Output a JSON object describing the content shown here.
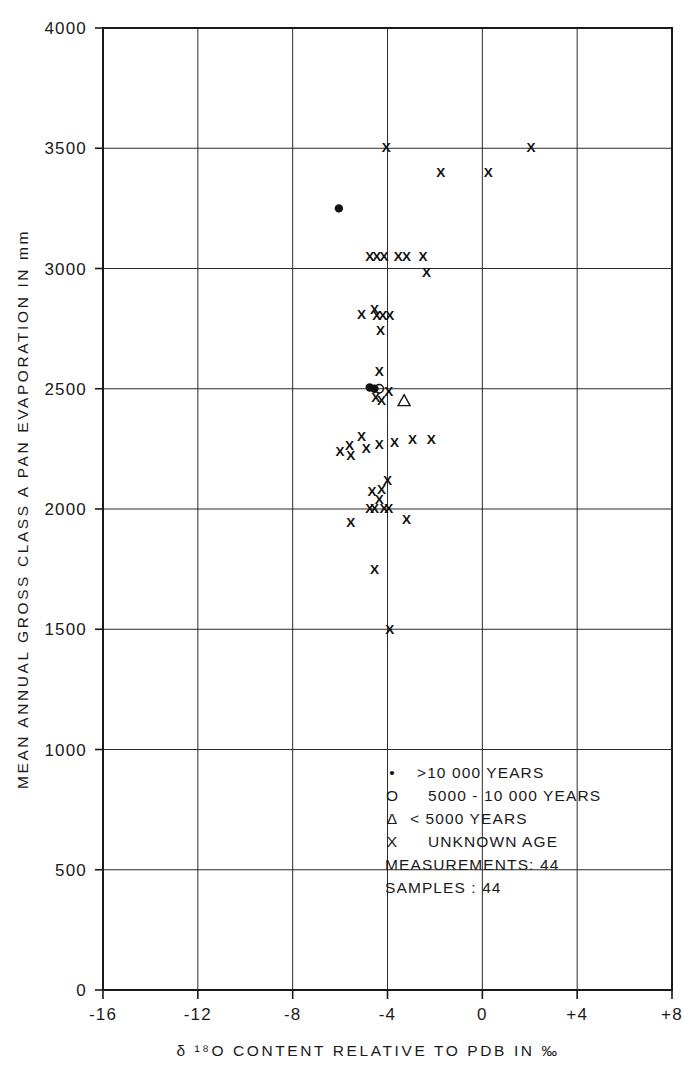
{
  "chart_data": {
    "type": "scatter",
    "title": "",
    "xlabel": "δ ¹⁸O CONTENT RELATIVE TO PDB IN ‰",
    "ylabel": "MEAN ANNUAL GROSS CLASS A PAN EVAPORATION IN mm",
    "xlim": [
      -16,
      8
    ],
    "ylim": [
      0,
      4000
    ],
    "xticks": [
      -16,
      -12,
      -8,
      -4,
      0,
      4,
      8
    ],
    "xtick_labels": [
      "-16",
      "-12",
      "-8",
      "-4",
      "0",
      "+4",
      "+8"
    ],
    "yticks": [
      0,
      500,
      1000,
      1500,
      2000,
      2500,
      3000,
      3500,
      4000
    ],
    "ytick_labels": [
      "0",
      "500",
      "1000",
      "1500",
      "2000",
      "2500",
      "3000",
      "3500",
      "4000"
    ],
    "grid": true,
    "grid_x": [
      -12,
      -8,
      -4,
      0,
      4
    ],
    "grid_y": [
      500,
      1000,
      1500,
      2000,
      2500,
      3000,
      3500
    ],
    "legend_position": "inside-lower-right",
    "series": [
      {
        "name": ">10 000 YEARS",
        "marker": "filled-circle",
        "points": [
          {
            "x": -6.05,
            "y": 3250
          },
          {
            "x": -4.75,
            "y": 2505
          },
          {
            "x": -4.55,
            "y": 2500
          }
        ]
      },
      {
        "name": "5000 - 10 000 YEARS",
        "marker": "open-circle",
        "points": [
          {
            "x": -4.35,
            "y": 2500
          }
        ]
      },
      {
        "name": "< 5000 YEARS",
        "marker": "triangle",
        "points": [
          {
            "x": -3.3,
            "y": 2450
          }
        ]
      },
      {
        "name": "UNKNOWN AGE",
        "marker": "x",
        "points": [
          {
            "x": -4.05,
            "y": 3505
          },
          {
            "x": 2.05,
            "y": 3505
          },
          {
            "x": -1.75,
            "y": 3400
          },
          {
            "x": 0.25,
            "y": 3400
          },
          {
            "x": -4.75,
            "y": 3050
          },
          {
            "x": -4.45,
            "y": 3050
          },
          {
            "x": -4.15,
            "y": 3050
          },
          {
            "x": -3.55,
            "y": 3050
          },
          {
            "x": -3.2,
            "y": 3050
          },
          {
            "x": -2.5,
            "y": 3050
          },
          {
            "x": -2.35,
            "y": 2985
          },
          {
            "x": -5.1,
            "y": 2810
          },
          {
            "x": -4.55,
            "y": 2830
          },
          {
            "x": -4.45,
            "y": 2805
          },
          {
            "x": -4.2,
            "y": 2805
          },
          {
            "x": -3.9,
            "y": 2805
          },
          {
            "x": -4.3,
            "y": 2745
          },
          {
            "x": -4.35,
            "y": 2575
          },
          {
            "x": -4.5,
            "y": 2465
          },
          {
            "x": -4.25,
            "y": 2455
          },
          {
            "x": -3.95,
            "y": 2490
          },
          {
            "x": -6.0,
            "y": 2240
          },
          {
            "x": -5.6,
            "y": 2265
          },
          {
            "x": -5.55,
            "y": 2225
          },
          {
            "x": -5.1,
            "y": 2305
          },
          {
            "x": -4.9,
            "y": 2255
          },
          {
            "x": -4.35,
            "y": 2270
          },
          {
            "x": -3.7,
            "y": 2280
          },
          {
            "x": -2.95,
            "y": 2290
          },
          {
            "x": -2.15,
            "y": 2290
          },
          {
            "x": -4.0,
            "y": 2120
          },
          {
            "x": -4.65,
            "y": 2075
          },
          {
            "x": -4.25,
            "y": 2085
          },
          {
            "x": -4.35,
            "y": 2040
          },
          {
            "x": -4.75,
            "y": 2005
          },
          {
            "x": -4.55,
            "y": 2005
          },
          {
            "x": -4.15,
            "y": 2005
          },
          {
            "x": -3.95,
            "y": 2005
          },
          {
            "x": -5.55,
            "y": 1945
          },
          {
            "x": -3.2,
            "y": 1960
          },
          {
            "x": -4.55,
            "y": 1750
          },
          {
            "x": -3.9,
            "y": 1500
          }
        ]
      }
    ],
    "legend": [
      {
        "symbol": "•",
        "label": ">10 000 YEARS"
      },
      {
        "symbol": "O",
        "label": "5000 - 10 000 YEARS"
      },
      {
        "symbol": "Δ",
        "label": "< 5000 YEARS"
      },
      {
        "symbol": "X",
        "label": "UNKNOWN AGE"
      }
    ],
    "annotations": [
      {
        "label": "MEASUREMENTS",
        "separator": ":",
        "value": "44"
      },
      {
        "label": "SAMPLES",
        "separator": ":",
        "value": "44"
      }
    ]
  },
  "legend_lines": {
    "l0_sym": "•",
    "l0_txt": ">10 000 YEARS",
    "l1_sym": "O",
    "l1_txt": "5000 - 10 000 YEARS",
    "l2_sym": "Δ",
    "l2_txt": "< 5000 YEARS",
    "l3_sym": "X",
    "l3_txt": "UNKNOWN AGE",
    "l4_txt": "MEASUREMENTS: 44",
    "l5_txt": "SAMPLES          : 44"
  },
  "axis_text": {
    "y_title": "MEAN ANNUAL GROSS CLASS A PAN EVAPORATION IN mm",
    "x_title": "δ ¹⁸O CONTENT RELATIVE TO PDB IN ‰"
  }
}
